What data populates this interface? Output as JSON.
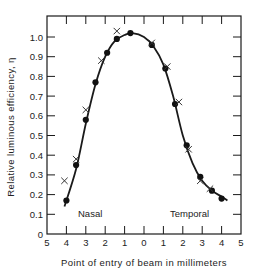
{
  "chart_data": {
    "type": "scatter",
    "title": "",
    "xlabel": "Point of entry of beam in millimeters",
    "ylabel": "Relative luminous efficiency, η",
    "x_tick_labels": [
      "5",
      "4",
      "3",
      "2",
      "1",
      "0",
      "1",
      "2",
      "3",
      "4",
      "5"
    ],
    "y_tick_labels": [
      "0",
      "0.1",
      "0.2",
      "0.3",
      "0.4",
      "0.5",
      "0.6",
      "0.7",
      "0.8",
      "0.9",
      "1.0"
    ],
    "xlim": [
      -5,
      5
    ],
    "ylim": [
      0,
      1.1
    ],
    "x_note": "Negative x = Nasal side, positive x = Temporal side (tick labels shown as absolute mm)",
    "annotations": [
      "Nasal",
      "Temporal"
    ],
    "grid": false,
    "series": [
      {
        "name": "Filled circles (measured)",
        "marker": "circle",
        "x": [
          -4.0,
          -3.5,
          -3.0,
          -2.5,
          -1.9,
          -1.4,
          -0.7,
          0.4,
          1.1,
          1.6,
          2.2,
          2.9,
          3.5,
          4.0
        ],
        "y": [
          0.17,
          0.35,
          0.58,
          0.77,
          0.92,
          0.99,
          1.02,
          0.96,
          0.84,
          0.66,
          0.45,
          0.29,
          0.22,
          0.18
        ]
      },
      {
        "name": "Crosses (measured)",
        "marker": "x",
        "x": [
          -4.1,
          -3.5,
          -3.0,
          -2.2,
          -1.4,
          0.4,
          1.2,
          1.8,
          2.3,
          2.9,
          3.4
        ],
        "y": [
          0.27,
          0.38,
          0.63,
          0.88,
          1.03,
          0.97,
          0.85,
          0.67,
          0.43,
          0.27,
          0.23
        ]
      },
      {
        "name": "Fitted curve",
        "marker": "line",
        "x": [
          -4.1,
          -3.5,
          -3.0,
          -2.5,
          -2.0,
          -1.5,
          -1.0,
          -0.6,
          0.0,
          0.5,
          1.0,
          1.5,
          2.0,
          2.5,
          3.0,
          3.5,
          4.0,
          4.3
        ],
        "y": [
          0.14,
          0.33,
          0.56,
          0.76,
          0.9,
          0.98,
          1.01,
          1.02,
          1.0,
          0.95,
          0.86,
          0.7,
          0.5,
          0.36,
          0.27,
          0.22,
          0.19,
          0.17
        ]
      }
    ]
  },
  "labels": {
    "nasal": "Nasal",
    "temporal": "Temporal"
  }
}
